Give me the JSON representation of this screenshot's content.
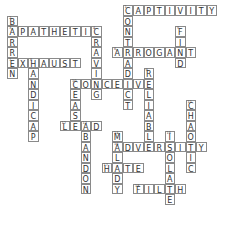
{
  "puzzle": {
    "cell_size": 10.5,
    "origin": {
      "x": 7,
      "y": 5
    },
    "words": [
      {
        "number": 1,
        "answer": "CAPTIVITY",
        "direction": "across",
        "row": 0,
        "col": 11
      },
      {
        "number": 1,
        "answer": "CONTRADICT",
        "direction": "down",
        "row": 0,
        "col": 11
      },
      {
        "number": 2,
        "answer": "BARREN",
        "direction": "down",
        "row": 1,
        "col": 0
      },
      {
        "number": 3,
        "answer": "APATHETIC",
        "direction": "across",
        "row": 2,
        "col": 0
      },
      {
        "number": 4,
        "answer": "CRAVING",
        "direction": "down",
        "row": 2,
        "col": 8
      },
      {
        "number": 5,
        "answer": "FIND",
        "direction": "down",
        "row": 2,
        "col": 16
      },
      {
        "number": 6,
        "answer": "ARROGANT",
        "direction": "across",
        "row": 4,
        "col": 10
      },
      {
        "number": 7,
        "answer": "EXHAUST",
        "direction": "across",
        "row": 5,
        "col": 0
      },
      {
        "number": 8,
        "answer": "HANDICAP",
        "direction": "down",
        "row": 5,
        "col": 2
      },
      {
        "number": 9,
        "answer": "RELIABLE",
        "direction": "down",
        "row": 6,
        "col": 13
      },
      {
        "number": 10,
        "answer": "CONCEIVE",
        "direction": "across",
        "row": 7,
        "col": 6
      },
      {
        "number": 10,
        "answer": "CEASE",
        "direction": "down",
        "row": 7,
        "col": 6
      },
      {
        "number": 11,
        "answer": "CHAOTIC",
        "direction": "down",
        "row": 9,
        "col": 17
      },
      {
        "number": 12,
        "answer": "LEAD",
        "direction": "across",
        "row": 11,
        "col": 5
      },
      {
        "number": 13,
        "answer": "ABANDON",
        "direction": "down",
        "row": 11,
        "col": 7
      },
      {
        "number": 14,
        "answer": "MALADY",
        "direction": "down",
        "row": 12,
        "col": 10
      },
      {
        "number": 15,
        "answer": "ISOLATE",
        "direction": "down",
        "row": 12,
        "col": 15
      },
      {
        "number": 16,
        "answer": "ADVERSITY",
        "direction": "across",
        "row": 13,
        "col": 10
      },
      {
        "number": 17,
        "answer": "HATE",
        "direction": "across",
        "row": 15,
        "col": 9
      },
      {
        "number": 18,
        "answer": "FILTH",
        "direction": "across",
        "row": 17,
        "col": 12
      }
    ]
  }
}
